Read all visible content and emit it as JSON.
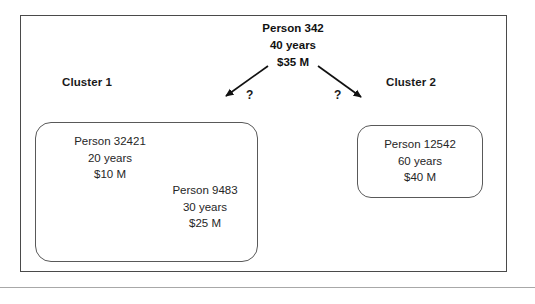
{
  "figure": {
    "root": {
      "name": "Person 342",
      "age": "40 years",
      "wealth": "$35 M"
    },
    "edges": [
      {
        "id": "edge-left",
        "label": "?",
        "target": "Cluster 1"
      },
      {
        "id": "edge-right",
        "label": "?",
        "target": "Cluster 2"
      }
    ],
    "clusters": [
      {
        "label": "Cluster 1",
        "members": [
          {
            "name": "Person 32421",
            "age": "20 years",
            "wealth": "$10 M"
          },
          {
            "name": "Person 9483",
            "age": "30 years",
            "wealth": "$25 M"
          }
        ]
      },
      {
        "label": "Cluster 2",
        "members": [
          {
            "name": "Person 12542",
            "age": "60 years",
            "wealth": "$40 M"
          }
        ]
      }
    ]
  },
  "colors": {
    "frame_stroke": "#4a4a4a",
    "box_stroke": "#595959",
    "text": "#262626",
    "arrow": "#111111",
    "rule": "#a8a8a8"
  }
}
